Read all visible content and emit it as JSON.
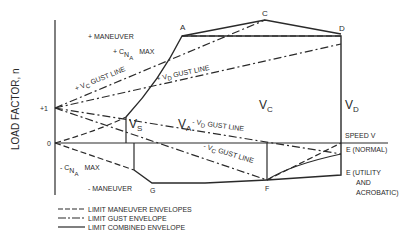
{
  "diagram": {
    "type": "V-n diagram",
    "y_axis_label": "LOAD FACTOR, n",
    "y_ticks": [
      "+1",
      "0"
    ],
    "x_axis_label": "SPEED V",
    "points": {
      "A": "A",
      "C": "C",
      "D": "D",
      "E_normal": "E (NORMAL)",
      "E_utility_line1": "E (UTILITY",
      "E_utility_line2": "AND",
      "E_utility_line3": "ACROBATIC)",
      "F": "F",
      "G": "G"
    },
    "speed_labels": {
      "vs": "V",
      "vs_sub": "S",
      "va": "V",
      "va_sub": "A",
      "vc": "V",
      "vc_sub": "C",
      "vd": "V",
      "vd_sub": "D"
    },
    "annotations": {
      "pos_maneuver": "+ MANEUVER",
      "pos_cna_prefix": "+ C",
      "pos_cna_sub": "N",
      "pos_cna_subsub": "A",
      "pos_cna_max": "MAX",
      "neg_maneuver": "- MANEUVER",
      "neg_cna_prefix": "- C",
      "neg_cna_sub": "N",
      "neg_cna_subsub": "A",
      "neg_cna_max": "MAX",
      "pos_vc_gust": "+ V",
      "pos_vc_gust_sub": "C",
      "pos_vc_gust_tail": "GUST LINE",
      "pos_vd_gust": "+ V",
      "pos_vd_gust_sub": "D",
      "pos_vd_gust_tail": "GUST LINE",
      "neg_vd_gust": "- V",
      "neg_vd_gust_sub": "D",
      "neg_vd_gust_tail": "GUST LINE",
      "neg_vc_gust": "- V",
      "neg_vc_gust_sub": "C",
      "neg_vc_gust_tail": "GUST LINE"
    },
    "legend": [
      {
        "style": "dashed",
        "label": "LIMIT MANEUVER ENVELOPES"
      },
      {
        "style": "dash-dot",
        "label": "LIMIT GUST ENVELOPE"
      },
      {
        "style": "solid",
        "label": "LIMIT COMBINED ENVELOPE"
      }
    ],
    "line_color": "#2a2a2a"
  }
}
